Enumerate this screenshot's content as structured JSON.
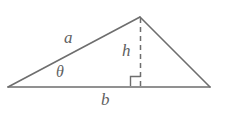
{
  "figure": {
    "type": "geometry-diagram",
    "background_color": "#ffffff",
    "stroke_color": "#6e6e6e",
    "label_color": "#5f5f5f",
    "labels": {
      "side_a": "a",
      "angle_theta": "θ",
      "height_h": "h",
      "base_b": "b"
    },
    "geometry": {
      "left_vertex": [
        8,
        87
      ],
      "right_vertex": [
        210,
        87
      ],
      "apex": [
        140,
        17
      ],
      "altitude_foot": [
        140,
        86
      ],
      "right_angle_marker": {
        "x": 140,
        "y": 76,
        "size": 10
      },
      "altitude_dash_pattern": "5 4"
    }
  }
}
